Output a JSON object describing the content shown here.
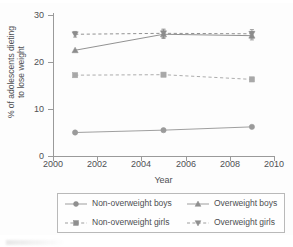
{
  "chart_data": {
    "type": "line",
    "title": "",
    "xlabel": "Year",
    "ylabel": "% of adolescents dieting\nto lose weight",
    "x": [
      2001,
      2005,
      2009
    ],
    "xlim": [
      2000,
      2010
    ],
    "ylim": [
      0,
      30
    ],
    "xticks": [
      "2000",
      "2002",
      "2004",
      "2006",
      "2008",
      "2010"
    ],
    "yticks": [
      "0",
      "10",
      "20",
      "30"
    ],
    "grid": false,
    "legend_position": "bottom",
    "series": [
      {
        "name": "Non-overweight boys",
        "marker": "circle",
        "linestyle": "solid",
        "color": "#9a9a9a",
        "values": [
          5.0,
          5.5,
          6.2
        ]
      },
      {
        "name": "Non-overweight girls",
        "marker": "square",
        "linestyle": "dashed",
        "color": "#a8a8a8",
        "values": [
          17.2,
          17.3,
          16.3
        ]
      },
      {
        "name": "Overweight boys",
        "marker": "triangle-up",
        "linestyle": "solid",
        "color": "#8c8c8c",
        "values": [
          22.5,
          25.9,
          25.6
        ]
      },
      {
        "name": "Overweight girls",
        "marker": "triangle-down",
        "linestyle": "dashed",
        "color": "#8c8c8c",
        "values": [
          25.9,
          26.1,
          26.0
        ]
      }
    ],
    "error_bars": {
      "Overweight boys": [
        0.0,
        0.9,
        0.9
      ],
      "Overweight girls": [
        0.6,
        0.9,
        0.9
      ]
    }
  },
  "axes": {
    "y_title_line1": "% of adolescents dieting",
    "y_title_line2": "to lose weight",
    "x_title": "Year",
    "y_tick_labels": [
      "30",
      "20",
      "10",
      "0"
    ],
    "x_tick_labels": [
      "2000",
      "2002",
      "2004",
      "2006",
      "2008",
      "2010"
    ]
  },
  "legend": {
    "entries": [
      {
        "label": "Non-overweight boys",
        "marker": "circle-marker",
        "dashed": false
      },
      {
        "label": "Overweight boys",
        "marker": "triangle-up-marker",
        "dashed": false
      },
      {
        "label": "Non-overweight girls",
        "marker": "square-marker",
        "dashed": true
      },
      {
        "label": "Overweight girls",
        "marker": "triangle-down-marker",
        "dashed": true
      }
    ]
  }
}
